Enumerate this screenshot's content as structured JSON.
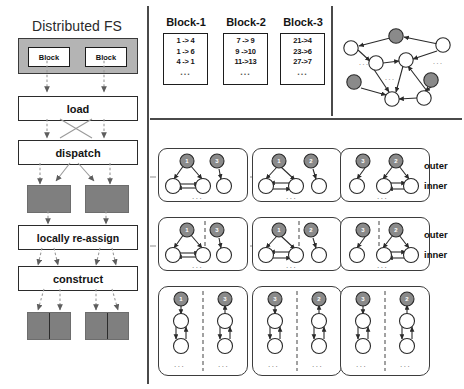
{
  "figure": {
    "left_panel": {
      "title": "Distributed FS",
      "blocks": [
        {
          "label": "Block"
        },
        {
          "label": "Block"
        }
      ],
      "stages": [
        {
          "label": "load"
        },
        {
          "label": "dispatch"
        },
        {
          "label": "locally re-assign"
        },
        {
          "label": "construct"
        }
      ]
    },
    "block_tables": [
      {
        "title": "Block-1",
        "rows": [
          "1 -> 4",
          "1 -> 6",
          "4 -> 1",
          "..."
        ]
      },
      {
        "title": "Block-2",
        "rows": [
          "7 -> 9",
          "9 ->10",
          "11->13",
          "..."
        ]
      },
      {
        "title": "Block-3",
        "rows": [
          "21->4",
          "23->6",
          "27->7",
          "..."
        ]
      }
    ],
    "graph_overview": {
      "ellipsis": [
        "...",
        "...",
        "..."
      ],
      "nodes": [
        {
          "id": "n1",
          "cx": 51,
          "cy": 26,
          "state": "dark"
        },
        {
          "id": "n2",
          "cx": 98,
          "cy": 35,
          "state": "open"
        },
        {
          "id": "n3",
          "cx": 6,
          "cy": 38,
          "state": "open"
        },
        {
          "id": "n4",
          "cx": 31,
          "cy": 53,
          "state": "open"
        },
        {
          "id": "n5",
          "cx": 61,
          "cy": 50,
          "state": "open"
        },
        {
          "id": "n6",
          "cx": 9,
          "cy": 72,
          "state": "dark"
        },
        {
          "id": "n7",
          "cx": 86,
          "cy": 70,
          "state": "dark"
        },
        {
          "id": "n8",
          "cx": 47,
          "cy": 89,
          "state": "open"
        },
        {
          "id": "n9",
          "cx": 79,
          "cy": 88,
          "state": "open"
        }
      ]
    },
    "partition_rows": [
      {
        "row_name": "row-1",
        "outer_label": "outer",
        "inner_label": "inner",
        "cells": [
          {
            "outer_nodes": [
              "1",
              "3"
            ],
            "dots": "..."
          },
          {
            "outer_nodes": [
              "1",
              "2"
            ],
            "dots": "..."
          },
          {
            "outer_nodes": [
              "3",
              "2"
            ],
            "dots": "..."
          }
        ]
      },
      {
        "row_name": "row-2",
        "outer_label": "outer",
        "inner_label": "inner",
        "cells": [
          {
            "outer_nodes": [
              "1",
              "3"
            ],
            "dots": "..."
          },
          {
            "outer_nodes": [
              "1",
              "2"
            ],
            "dots": "..."
          },
          {
            "outer_nodes": [
              "3",
              "2"
            ],
            "dots": "..."
          }
        ]
      },
      {
        "row_name": "row-3",
        "outer_label": "",
        "inner_label": "",
        "cells": [
          {
            "outer_nodes": [
              "1",
              "3"
            ],
            "dots": "..."
          },
          {
            "outer_nodes": [
              "3",
              "2"
            ],
            "dots": "..."
          },
          {
            "outer_nodes": [
              "3",
              "2"
            ],
            "dots": "..."
          }
        ]
      }
    ],
    "colors": {
      "dark_node": "#8a8a8a",
      "gray_box": "#7f7f7f",
      "fs_container": "#b4b4b4",
      "stroke": "#2a2a2a",
      "dashed_flow": "#9a9a9a"
    }
  }
}
